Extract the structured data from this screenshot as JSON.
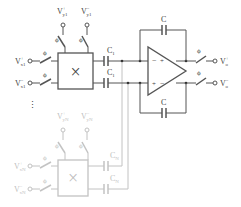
{
  "diagram": {
    "colors": {
      "wire": "#555555",
      "faded_wire": "#bbbbbb",
      "text": "#444444",
      "background": "#ffffff"
    },
    "stage1": {
      "inputs": {
        "x_plus": "V",
        "x_plus_sup": "+",
        "x_plus_sub": "x1",
        "x_minus": "V",
        "x_minus_sup": "−",
        "x_minus_sub": "x1",
        "y_plus": "V",
        "y_plus_sup": "+",
        "y_plus_sub": "y1",
        "y_minus": "V",
        "y_minus_sup": "−",
        "y_minus_sub": "y1"
      },
      "switch_label": "ϕ",
      "mixer_symbol": "×",
      "cap_label": "C",
      "cap_sub": "1"
    },
    "stageN": {
      "inputs": {
        "x_plus": "V",
        "x_plus_sup": "+",
        "x_plus_sub": "xN",
        "x_minus": "V",
        "x_minus_sup": "−",
        "x_minus_sub": "xN",
        "y_plus": "V",
        "y_plus_sup": "+",
        "y_plus_sub": "yN",
        "y_minus": "V",
        "y_minus_sup": "−",
        "y_minus_sub": "yN"
      },
      "switch_label": "ϕ",
      "mixer_symbol": "×",
      "cap_label": "C",
      "cap_sub": "N"
    },
    "ellipsis": "⋮",
    "opamp": {
      "in_top": "−",
      "out_top": "+",
      "in_bottom": "+",
      "out_bottom": "−"
    },
    "feedback_cap": "C",
    "outputs": {
      "plus": "V",
      "plus_sup": "+",
      "plus_sub": "o",
      "minus": "V",
      "minus_sup": "−",
      "minus_sub": "o"
    },
    "output_switch_label": "ϕ"
  }
}
